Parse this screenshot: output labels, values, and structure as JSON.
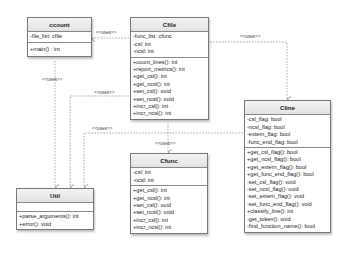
{
  "diagram": {
    "type": "uml-class-diagram",
    "relation_label": "<<uses>>",
    "classes": {
      "ccount": {
        "name": "ccount",
        "attributes": [
          "-file_list: cfile"
        ],
        "methods": [
          "+main() : int"
        ]
      },
      "cfile": {
        "name": "Cfile",
        "attributes": [
          "-func_list: cfunc",
          "-csl: int",
          "-ncsl: int"
        ],
        "methods": [
          "+count_lines(): int",
          "+report_metrics(): int",
          "+get_csl(): int",
          "+get_ncsl(): int",
          "+set_csl(): void",
          "+set_ncsl(): void",
          "+incr_csl(): int",
          "+incr_ncsl(): int"
        ]
      },
      "cline": {
        "name": "Cline",
        "attributes": [
          "-csl_flag: bool",
          "-ncsl_flag: bool",
          "-extern_flag: bool",
          "-func_end_flag: bool"
        ],
        "methods": [
          "+get_csl_flag(): bool",
          "+get_ncsl_flag(): bool",
          "+get_extern_flag(): bool",
          "+get_func_end_flag(): bool",
          "-set_csl_flag(): void",
          "-set_ncsl_flag(): void",
          "-set_extern_flag(): void",
          "-set_func_end_flag(): void",
          "+classify_line(): int",
          "-get_token(): void",
          "-find_function_name(): bool"
        ]
      },
      "cfunc": {
        "name": "Cfunc",
        "attributes": [
          "-csl: int",
          "-ncsl: int"
        ],
        "methods": [
          "+get_csl(): int",
          "+get_ncsl(): int",
          "+set_csl(): void",
          "+set_ncsl(): void",
          "+incr_csl(): int",
          "+incr_ncsl(): int"
        ]
      },
      "util": {
        "name": "Util",
        "attributes": [],
        "methods": [
          "+parse_arguments(): int",
          "+error(): void"
        ]
      }
    },
    "relations": [
      {
        "from": "ccount",
        "to": "Cfile",
        "label": "<<uses>>"
      },
      {
        "from": "ccount",
        "to": "Util",
        "label": "<<uses>>"
      },
      {
        "from": "Cfile",
        "to": "Cline",
        "label": "<<uses>>"
      },
      {
        "from": "Cfile",
        "to": "Util",
        "label": "<<uses>>"
      },
      {
        "from": "Cfile",
        "to": "Cfunc",
        "label": "<<uses>>"
      },
      {
        "from": "Cline",
        "to": "Util",
        "label": "<<uses>>"
      }
    ]
  }
}
